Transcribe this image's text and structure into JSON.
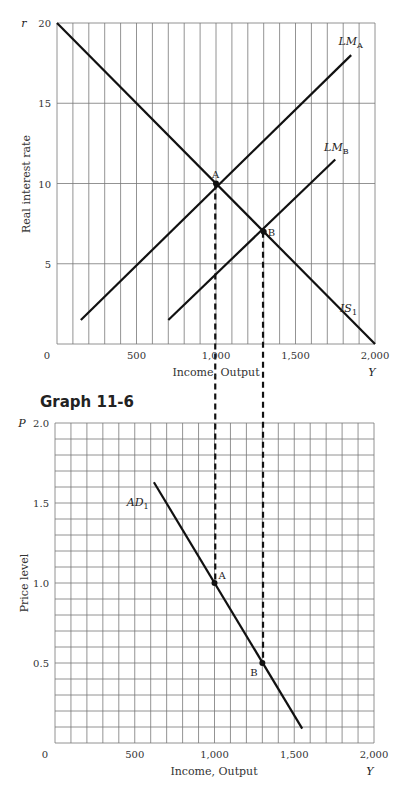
{
  "graph_title": "Graph 11-6",
  "chart_data": [
    {
      "type": "line",
      "title": "IS-LM",
      "xlabel": "Income, Output",
      "xlabel_symbol": "Y",
      "ylabel": "Real interest rate",
      "ylabel_symbol": "r",
      "xlim": [
        0,
        2000
      ],
      "ylim": [
        0,
        20
      ],
      "x_ticks": [
        "0",
        "500",
        "1,000",
        "1,500",
        "2,000"
      ],
      "y_ticks": [
        "5",
        "10",
        "15",
        "20"
      ],
      "grid": {
        "x_step": 100,
        "y_step": 5
      },
      "series": [
        {
          "name": "IS1",
          "label_main": "IS",
          "label_sub": "1",
          "points": [
            [
              0,
              20
            ],
            [
              2000,
              0
            ]
          ]
        },
        {
          "name": "LMA",
          "label_main": "LM",
          "label_sub": "A",
          "points": [
            [
              150,
              1.5
            ],
            [
              1850,
              18
            ]
          ]
        },
        {
          "name": "LMB",
          "label_main": "LM",
          "label_sub": "B",
          "points": [
            [
              700,
              1.5
            ],
            [
              1750,
              11.5
            ]
          ]
        }
      ],
      "annotations": [
        {
          "label": "A",
          "x": 1000,
          "y": 10
        },
        {
          "label": "B",
          "x": 1300,
          "y": 7
        }
      ]
    },
    {
      "type": "line",
      "title": "Aggregate Demand",
      "xlabel": "Income, Output",
      "xlabel_symbol": "Y",
      "ylabel": "Price level",
      "ylabel_symbol": "P",
      "xlim": [
        0,
        2000
      ],
      "ylim": [
        0,
        2.0
      ],
      "x_ticks": [
        "0",
        "500",
        "1,000",
        "1,500",
        "2,000"
      ],
      "y_ticks": [
        "0.5",
        "1.0",
        "1.5",
        "2.0"
      ],
      "grid": {
        "x_step": 100,
        "y_step": 0.1
      },
      "series": [
        {
          "name": "AD1",
          "label_main": "AD",
          "label_sub": "1",
          "points": [
            [
              620,
              1.63
            ],
            [
              1550,
              0.09
            ]
          ]
        }
      ],
      "annotations": [
        {
          "label": "A",
          "x": 1000,
          "y": 1.0
        },
        {
          "label": "B",
          "x": 1300,
          "y": 0.5
        }
      ],
      "dashed_connectors": [
        1000,
        1300
      ]
    }
  ]
}
